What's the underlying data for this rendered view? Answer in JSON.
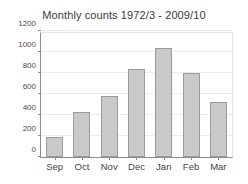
{
  "chart_data": {
    "type": "bar",
    "title": "Monthly counts 1972/3 - 2009/10",
    "xlabel": "",
    "ylabel": "",
    "categories": [
      "Sep",
      "Oct",
      "Nov",
      "Dec",
      "Jan",
      "Feb",
      "Mar"
    ],
    "values": [
      190,
      430,
      580,
      840,
      1040,
      800,
      520
    ],
    "ylim": [
      0,
      1200
    ],
    "yticks": [
      0,
      200,
      400,
      600,
      800,
      1000,
      1200
    ],
    "ytick_labels": [
      "0",
      "200",
      "400",
      "600",
      "800",
      "1000",
      "1200"
    ],
    "grid": true,
    "legend": false,
    "bar_fill_color": "#c9c9c9",
    "bar_edge_color": "#9a9a9a",
    "axis_color": "#8c8c8c",
    "grid_color": "#ececec",
    "background_color": "#ffffff",
    "title_color": "#3a3a3a"
  }
}
